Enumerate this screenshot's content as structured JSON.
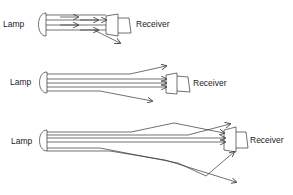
{
  "diagrams": [
    {
      "id": "direct",
      "lamp_label": "Lamp",
      "receiver_label": "Receiver"
    },
    {
      "id": "long-range",
      "lamp_label": "Lamp",
      "receiver_label": "Receiver"
    },
    {
      "id": "longer-range",
      "lamp_label": "Lamp",
      "receiver_label": "Receiver"
    }
  ],
  "colors": {
    "line": "#333333",
    "background": "#ffffff"
  }
}
